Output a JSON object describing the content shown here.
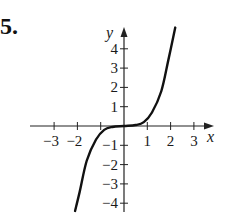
{
  "problem_number": "5.",
  "chart_data": {
    "type": "line",
    "title": "",
    "xlabel": "x",
    "ylabel": "y",
    "xlim": [
      -3.4,
      3.6
    ],
    "ylim": [
      -4.5,
      5.2
    ],
    "x_ticks": [
      -3,
      -2,
      -1,
      1,
      2,
      3
    ],
    "y_ticks": [
      -4,
      -3,
      -2,
      -1,
      1,
      2,
      3,
      4
    ],
    "x_tick_labels": [
      "−3",
      "−2",
      "−1",
      "1",
      "2",
      "3"
    ],
    "y_tick_labels": [
      "−4",
      "−3",
      "−2",
      "−1",
      "1",
      "2",
      "3",
      "4"
    ],
    "grid": false,
    "series": [
      {
        "name": "curve",
        "x": [
          -2.1,
          -1.9,
          -1.6,
          -1.2,
          -0.85,
          -0.5,
          0,
          0.5,
          0.85,
          1.2,
          1.6,
          1.9,
          2.2
        ],
        "y": [
          -4.4,
          -3.4,
          -1.8,
          -0.7,
          -0.2,
          -0.05,
          0,
          0.05,
          0.2,
          0.7,
          1.8,
          3.4,
          5.1
        ]
      }
    ]
  }
}
